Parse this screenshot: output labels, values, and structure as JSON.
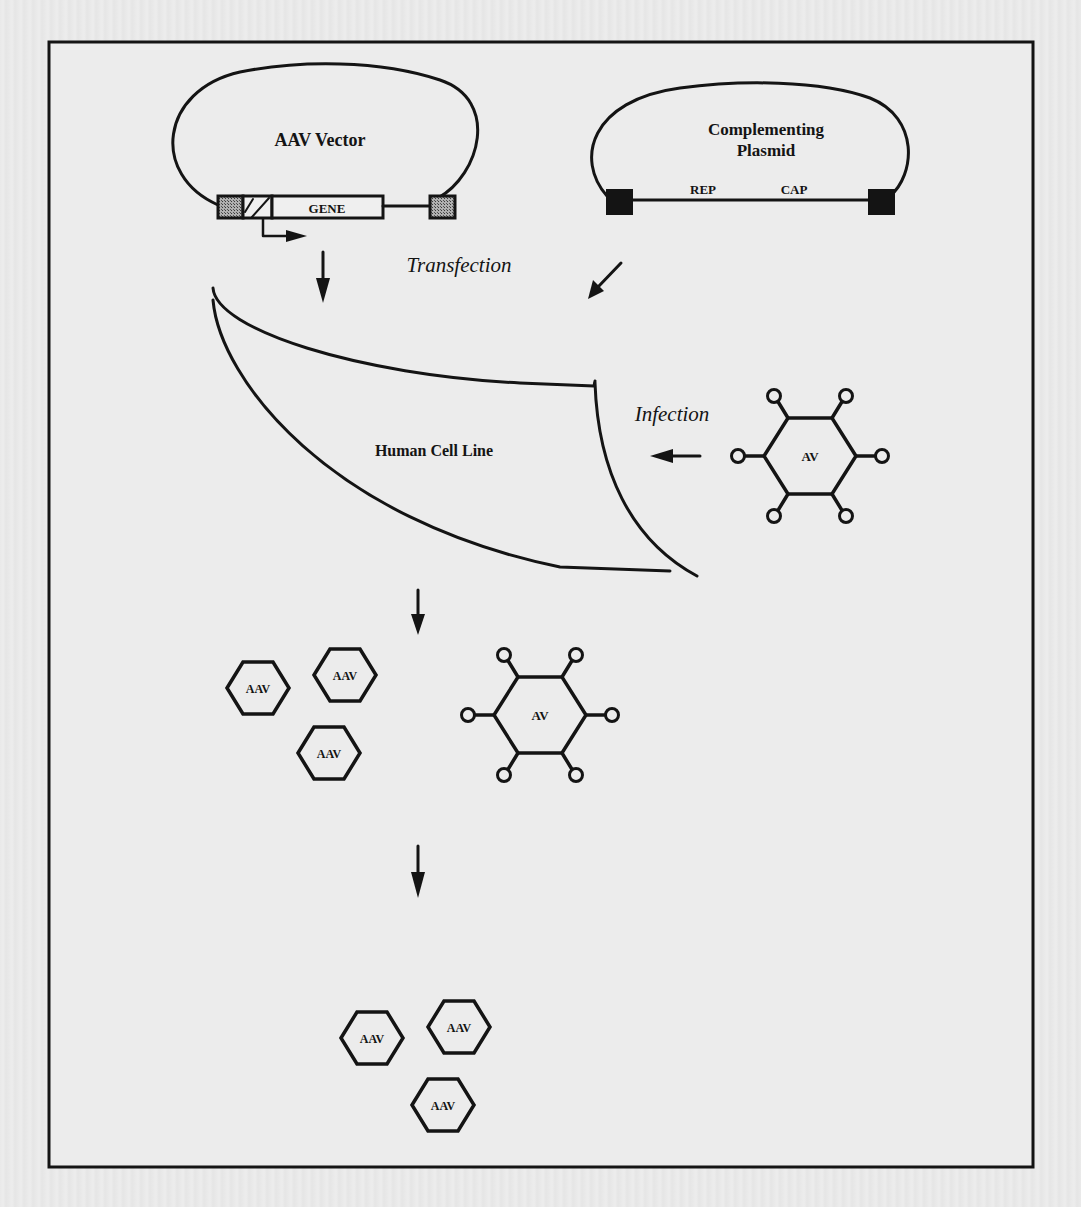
{
  "figure": {
    "aav_vector": {
      "title": "AAV Vector",
      "gene_label": "GENE"
    },
    "complementing_plasmid": {
      "title_line1": "Complementing",
      "title_line2": "Plasmid",
      "rep_label": "REP",
      "cap_label": "CAP"
    },
    "steps": {
      "transfection": "Transfection",
      "infection": "Infection"
    },
    "cell_line": {
      "label": "Human Cell Line"
    },
    "virus_labels": {
      "av": "AV",
      "aav": "AAV"
    },
    "helper_virus_1": {
      "label": "AV"
    },
    "helper_virus_2": {
      "label": "AV"
    },
    "progeny_group_1": {
      "labels": [
        "AAV",
        "AAV",
        "AAV"
      ]
    },
    "progeny_group_2": {
      "labels": [
        "AAV",
        "AAV",
        "AAV"
      ]
    }
  },
  "colors": {
    "ink": "#141414",
    "paper": "#e9e9e9",
    "itr_fill": "#8a8a8a",
    "box_fill": "#efefef"
  }
}
